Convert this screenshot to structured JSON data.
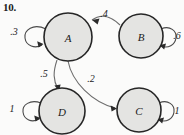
{
  "figure": {
    "problem_number": "10.",
    "type": "state-transition-diagram",
    "background_color": "#fbfbfa",
    "node_fill_color": "#e4e4e2",
    "node_stroke_color": "#262626",
    "edge_color": "#6d6d6d",
    "label_color": "#1a1a1a"
  },
  "nodes": [
    {
      "id": "A",
      "label": "A",
      "cx": 68,
      "cy": 37,
      "r": 24
    },
    {
      "id": "B",
      "label": "B",
      "cx": 141,
      "cy": 36,
      "r": 22
    },
    {
      "id": "D",
      "label": "D",
      "cx": 62,
      "cy": 111,
      "r": 23
    },
    {
      "id": "C",
      "label": "C",
      "cx": 139,
      "cy": 110,
      "r": 22
    }
  ],
  "edges": [
    {
      "from": "A",
      "to": "A",
      "label": ".3",
      "kind": "self-loop",
      "side": "left",
      "label_x": 14,
      "label_y": 31
    },
    {
      "from": "B",
      "to": "B",
      "label": ".6",
      "kind": "self-loop",
      "side": "right",
      "label_x": 176,
      "label_y": 35
    },
    {
      "from": "D",
      "to": "D",
      "label": "1",
      "kind": "self-loop",
      "side": "left",
      "label_x": 12,
      "label_y": 108
    },
    {
      "from": "C",
      "to": "C",
      "label": "1",
      "kind": "self-loop",
      "side": "right",
      "label_x": 176,
      "label_y": 110
    },
    {
      "from": "B",
      "to": "A",
      "label": ".4",
      "kind": "curve",
      "label_x": 104,
      "label_y": 13
    },
    {
      "from": "A",
      "to": "D",
      "label": ".5",
      "kind": "curve",
      "label_x": 44,
      "label_y": 73
    },
    {
      "from": "A",
      "to": "C",
      "label": ".2",
      "kind": "curve",
      "label_x": 91,
      "label_y": 78
    }
  ]
}
